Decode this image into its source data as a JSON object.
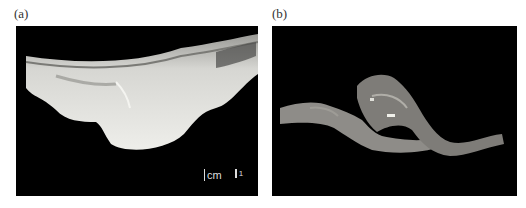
{
  "figure": {
    "panels": [
      {
        "label": "(a)",
        "description": "Gross specimen, pale tissue with large rounded bulging mass on black background",
        "scale_bar": {
          "unit": "cm",
          "tick": "1"
        }
      },
      {
        "label": "(b)",
        "description": "Gross specimen, tortuous tubular tissue with central mass on black background"
      }
    ],
    "colors": {
      "background": "#000000",
      "tissue_a": "#e4e4e0",
      "tissue_b": "#8c8c88"
    }
  }
}
